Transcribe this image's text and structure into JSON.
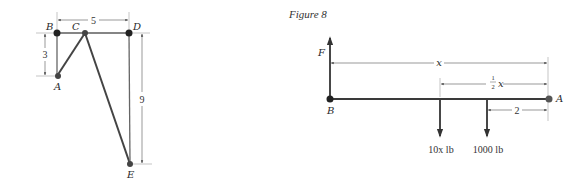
{
  "left_figure": {
    "points": {
      "A": {
        "label": "A",
        "x": 57,
        "y": 76
      },
      "B": {
        "label": "B",
        "x": 57,
        "y": 33
      },
      "C": {
        "label": "C",
        "x": 85,
        "y": 33
      },
      "D": {
        "label": "D",
        "x": 129,
        "y": 33
      },
      "E": {
        "label": "E",
        "x": 130,
        "y": 164
      }
    },
    "dimensions": {
      "horizontal_BD": "5",
      "vertical_BA": "3",
      "vertical_DE": "9"
    }
  },
  "right_figure": {
    "title": "Figure 8",
    "points": {
      "A": {
        "label": "A"
      },
      "B": {
        "label": "B"
      }
    },
    "force_up": {
      "label": "F"
    },
    "dimensions": {
      "total": "x",
      "half_numerator": "1",
      "half_denominator": "2",
      "half_var": "x",
      "from_A": "2"
    },
    "loads": [
      {
        "label": "10x lb"
      },
      {
        "label": "1000 lb"
      }
    ]
  }
}
